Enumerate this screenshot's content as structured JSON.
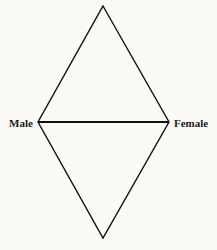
{
  "diagram": {
    "type": "diamond",
    "labels": {
      "left": "Male",
      "right": "Female"
    },
    "vertices": {
      "top": [
        103,
        6
      ],
      "left": [
        38,
        122
      ],
      "right": [
        169,
        122
      ],
      "bottom": [
        103,
        238
      ]
    },
    "line_color": "#111111",
    "background_color": "#fbfaf6"
  }
}
